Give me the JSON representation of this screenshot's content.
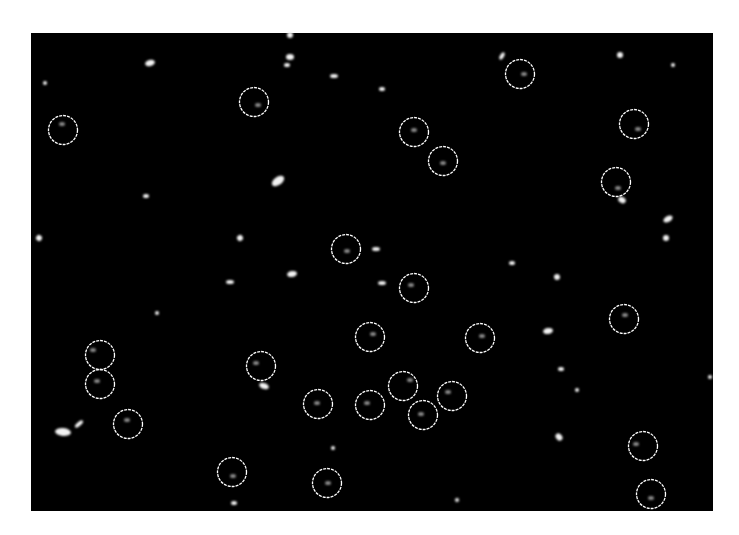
{
  "figure": {
    "frame": {
      "x": 31,
      "y": 33,
      "width": 682,
      "height": 478
    },
    "colors": {
      "background": "#ffffff",
      "field": "#000000",
      "circle": "#ffffff",
      "spot": "#f2f2f2",
      "faint_spot": "#8a8a8a"
    },
    "circle_radius": 14.5,
    "circled_particles": [
      {
        "x": 63,
        "y": 130,
        "sx": 62,
        "sy": 124
      },
      {
        "x": 254,
        "y": 102,
        "sx": 258,
        "sy": 105
      },
      {
        "x": 520,
        "y": 74,
        "sx": 524,
        "sy": 74
      },
      {
        "x": 414,
        "y": 132,
        "sx": 414,
        "sy": 130
      },
      {
        "x": 443,
        "y": 161,
        "sx": 443,
        "sy": 163
      },
      {
        "x": 634,
        "y": 124,
        "sx": 638,
        "sy": 129
      },
      {
        "x": 616,
        "y": 182,
        "sx": 618,
        "sy": 188
      },
      {
        "x": 346,
        "y": 249,
        "sx": 347,
        "sy": 251
      },
      {
        "x": 414,
        "y": 288,
        "sx": 411,
        "sy": 285
      },
      {
        "x": 370,
        "y": 337,
        "sx": 373,
        "sy": 334
      },
      {
        "x": 480,
        "y": 338,
        "sx": 482,
        "sy": 336
      },
      {
        "x": 624,
        "y": 319,
        "sx": 625,
        "sy": 315
      },
      {
        "x": 100,
        "y": 355,
        "sx": 93,
        "sy": 350
      },
      {
        "x": 100,
        "y": 384,
        "sx": 97,
        "sy": 381
      },
      {
        "x": 261,
        "y": 366,
        "sx": 256,
        "sy": 363
      },
      {
        "x": 128,
        "y": 424,
        "sx": 127,
        "sy": 420
      },
      {
        "x": 318,
        "y": 404,
        "sx": 317,
        "sy": 403
      },
      {
        "x": 370,
        "y": 405,
        "sx": 367,
        "sy": 403
      },
      {
        "x": 403,
        "y": 386,
        "sx": 410,
        "sy": 380
      },
      {
        "x": 452,
        "y": 396,
        "sx": 448,
        "sy": 392
      },
      {
        "x": 423,
        "y": 415,
        "sx": 421,
        "sy": 414
      },
      {
        "x": 643,
        "y": 446,
        "sx": 636,
        "sy": 444
      },
      {
        "x": 232,
        "y": 472,
        "sx": 233,
        "sy": 476
      },
      {
        "x": 327,
        "y": 483,
        "sx": 328,
        "sy": 483
      },
      {
        "x": 651,
        "y": 494,
        "sx": 651,
        "sy": 498
      }
    ],
    "bright_spots": [
      {
        "x": 150,
        "y": 63,
        "rx": 5,
        "ry": 3,
        "rot": -15
      },
      {
        "x": 290,
        "y": 35,
        "rx": 3,
        "ry": 3,
        "rot": 0
      },
      {
        "x": 290,
        "y": 57,
        "rx": 4,
        "ry": 3,
        "rot": 0
      },
      {
        "x": 287,
        "y": 65,
        "rx": 3,
        "ry": 2,
        "rot": 0
      },
      {
        "x": 334,
        "y": 76,
        "rx": 4,
        "ry": 2,
        "rot": 0
      },
      {
        "x": 382,
        "y": 89,
        "rx": 3,
        "ry": 2,
        "rot": 0
      },
      {
        "x": 502,
        "y": 56,
        "rx": 2,
        "ry": 4,
        "rot": 30
      },
      {
        "x": 620,
        "y": 55,
        "rx": 3,
        "ry": 3,
        "rot": 0
      },
      {
        "x": 673,
        "y": 65,
        "rx": 2,
        "ry": 2,
        "rot": 0
      },
      {
        "x": 45,
        "y": 83,
        "rx": 2,
        "ry": 2,
        "rot": 0
      },
      {
        "x": 278,
        "y": 181,
        "rx": 7,
        "ry": 4,
        "rot": -35
      },
      {
        "x": 146,
        "y": 196,
        "rx": 3,
        "ry": 2,
        "rot": 0
      },
      {
        "x": 39,
        "y": 238,
        "rx": 3,
        "ry": 3,
        "rot": 30
      },
      {
        "x": 240,
        "y": 238,
        "rx": 3,
        "ry": 3,
        "rot": -30
      },
      {
        "x": 376,
        "y": 249,
        "rx": 4,
        "ry": 2,
        "rot": 0
      },
      {
        "x": 292,
        "y": 274,
        "rx": 5,
        "ry": 3,
        "rot": -10
      },
      {
        "x": 230,
        "y": 282,
        "rx": 4,
        "ry": 2,
        "rot": 0
      },
      {
        "x": 382,
        "y": 283,
        "rx": 4,
        "ry": 2,
        "rot": 0
      },
      {
        "x": 376,
        "y": 359,
        "rx": 0,
        "ry": 0,
        "rot": 0
      },
      {
        "x": 512,
        "y": 263,
        "rx": 3,
        "ry": 2,
        "rot": 0
      },
      {
        "x": 557,
        "y": 277,
        "rx": 3,
        "ry": 3,
        "rot": -20
      },
      {
        "x": 668,
        "y": 219,
        "rx": 5,
        "ry": 3,
        "rot": -30
      },
      {
        "x": 666,
        "y": 238,
        "rx": 3,
        "ry": 3,
        "rot": 0
      },
      {
        "x": 622,
        "y": 200,
        "rx": 4,
        "ry": 3,
        "rot": 30
      },
      {
        "x": 548,
        "y": 331,
        "rx": 5,
        "ry": 3,
        "rot": -10
      },
      {
        "x": 561,
        "y": 369,
        "rx": 3,
        "ry": 2,
        "rot": 0
      },
      {
        "x": 577,
        "y": 390,
        "rx": 2,
        "ry": 2,
        "rot": 0
      },
      {
        "x": 559,
        "y": 437,
        "rx": 3,
        "ry": 4,
        "rot": -40
      },
      {
        "x": 264,
        "y": 386,
        "rx": 5,
        "ry": 3,
        "rot": 20
      },
      {
        "x": 63,
        "y": 432,
        "rx": 8,
        "ry": 4,
        "rot": 5
      },
      {
        "x": 79,
        "y": 424,
        "rx": 5,
        "ry": 2,
        "rot": -40
      },
      {
        "x": 234,
        "y": 503,
        "rx": 3,
        "ry": 2,
        "rot": 0
      },
      {
        "x": 157,
        "y": 313,
        "rx": 2,
        "ry": 2,
        "rot": 0
      },
      {
        "x": 333,
        "y": 448,
        "rx": 2,
        "ry": 2,
        "rot": 0
      },
      {
        "x": 457,
        "y": 500,
        "rx": 2,
        "ry": 2,
        "rot": -30
      },
      {
        "x": 710,
        "y": 377,
        "rx": 2,
        "ry": 2,
        "rot": 0
      }
    ]
  }
}
